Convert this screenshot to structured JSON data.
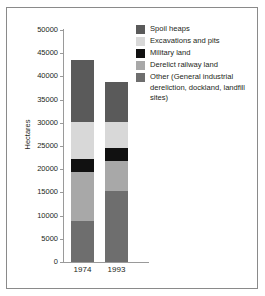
{
  "chart_data": {
    "type": "bar",
    "subtype": "stacked",
    "title": "",
    "xlabel": "",
    "ylabel": "Hectares",
    "categories": [
      "1974",
      "1993"
    ],
    "ylim": [
      0,
      50000
    ],
    "yticks": [
      0,
      5000,
      10000,
      15000,
      20000,
      25000,
      30000,
      35000,
      40000,
      45000,
      50000
    ],
    "ytick_labels": [
      "0",
      "5000",
      "10000",
      "15000",
      "20000",
      "25000",
      "30000",
      "35000",
      "40000",
      "45000",
      "50000"
    ],
    "grid": false,
    "legend_position": "top-right",
    "series": [
      {
        "name": "Other (General industrial dereliction, dockland, landfill sites)",
        "legend_label": "Other (General industrial dereliction, dockland, landfill sites)",
        "color": "#6e6e6e",
        "values": [
          8800,
          15200
        ]
      },
      {
        "name": "Derelict railway land",
        "legend_label": "Derelict railway land",
        "color": "#a8a8a8",
        "values": [
          10600,
          6600
        ]
      },
      {
        "name": "Military land",
        "legend_label": "Military land",
        "color": "#111111",
        "values": [
          2800,
          2700
        ]
      },
      {
        "name": "Excavations and pits",
        "legend_label": "Excavations and pits",
        "color": "#d8d8d8",
        "values": [
          8000,
          5700
        ]
      },
      {
        "name": "Spoil heaps",
        "legend_label": "Spoil heaps",
        "color": "#5a5a5a",
        "values": [
          13300,
          8600
        ]
      }
    ],
    "totals": [
      43500,
      38800
    ],
    "stack_order_bottom_to_top": [
      "Other (General industrial dereliction, dockland, landfill sites)",
      "Derelict railway land",
      "Military land",
      "Excavations and pits",
      "Spoil heaps"
    ]
  },
  "legend": {
    "items": [
      {
        "label": "Spoil heaps",
        "color": "#5a5a5a"
      },
      {
        "label": "Excavations and pits",
        "color": "#d8d8d8"
      },
      {
        "label": "Military land",
        "color": "#111111"
      },
      {
        "label": "Derelict railway land",
        "color": "#a8a8a8"
      },
      {
        "label": "Other (General industrial dereliction, dockland, landfill sites)",
        "color": "#6e6e6e"
      }
    ],
    "multiline_last_item": [
      "Other (General industrial",
      "dereliction, dockland,",
      "landfill sites)"
    ]
  },
  "colors": {
    "frame": "#8a8a8a",
    "axis": "#9a9a9a",
    "text": "#231f20",
    "background": "#ffffff"
  }
}
